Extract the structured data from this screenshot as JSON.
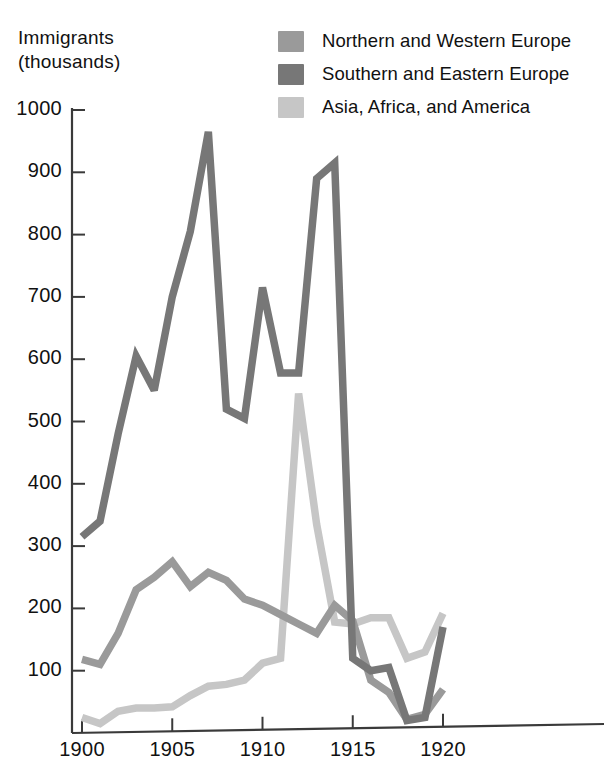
{
  "axis_title": "Immigrants\n(thousands)",
  "legend": {
    "items": [
      {
        "label": "Northern and Western Europe",
        "color": "#9a9a9a",
        "swatch_name": "legend-swatch-northern-western-europe"
      },
      {
        "label": "Southern and Eastern Europe",
        "color": "#777777",
        "swatch_name": "legend-swatch-southern-eastern-europe"
      },
      {
        "label": "Asia, Africa, and America",
        "color": "#c6c6c6",
        "swatch_name": "legend-swatch-asia-africa-america"
      }
    ]
  },
  "chart_data": {
    "type": "line",
    "title": "Immigrants (thousands)",
    "xlabel": "",
    "ylabel": "Immigrants (thousands)",
    "xlim": [
      1900,
      1920
    ],
    "ylim": [
      0,
      1000
    ],
    "xticks": [
      1900,
      1905,
      1910,
      1915,
      1920
    ],
    "yticks": [
      100,
      200,
      300,
      400,
      500,
      600,
      700,
      800,
      900,
      1000
    ],
    "grid": false,
    "legend_position": "top-right",
    "x": [
      1900,
      1901,
      1902,
      1903,
      1904,
      1905,
      1906,
      1907,
      1908,
      1909,
      1910,
      1911,
      1912,
      1913,
      1914,
      1915,
      1916,
      1917,
      1918,
      1919,
      1920
    ],
    "series": [
      {
        "name": "Northern and Western Europe",
        "color": "#9a9a9a",
        "values": [
          118,
          110,
          160,
          230,
          250,
          275,
          235,
          258,
          245,
          215,
          205,
          190,
          175,
          160,
          205,
          180,
          85,
          65,
          22,
          30,
          70
        ]
      },
      {
        "name": "Southern and Eastern Europe",
        "color": "#777777",
        "values": [
          315,
          340,
          480,
          605,
          550,
          700,
          805,
          965,
          520,
          505,
          715,
          578,
          578,
          890,
          915,
          120,
          100,
          105,
          20,
          25,
          170
        ]
      },
      {
        "name": "Asia, Africa, and America",
        "color": "#c6c6c6",
        "values": [
          25,
          15,
          35,
          40,
          40,
          42,
          60,
          75,
          78,
          85,
          112,
          120,
          545,
          335,
          178,
          175,
          185,
          185,
          120,
          130,
          192
        ]
      }
    ]
  },
  "axis": {
    "ytick_labels": [
      "1000",
      "900",
      "800",
      "700",
      "600",
      "500",
      "400",
      "300",
      "200",
      "100"
    ],
    "xtick_labels": [
      "1900",
      "1905",
      "1910",
      "1915",
      "1920"
    ]
  }
}
